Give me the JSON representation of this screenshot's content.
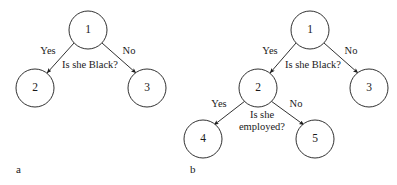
{
  "figure": {
    "width": 397,
    "height": 185,
    "background": "#ffffff",
    "stroke_color": "#1a1a1a"
  },
  "panels": [
    {
      "caption": "a",
      "caption_x": 16,
      "caption_y": 170,
      "nodes": [
        {
          "id": "a1",
          "label": "1",
          "cx": 88,
          "cy": 30,
          "r": 19
        },
        {
          "id": "a2",
          "label": "2",
          "cx": 35,
          "cy": 88,
          "r": 19
        },
        {
          "id": "a3",
          "label": "3",
          "cx": 147,
          "cy": 88,
          "r": 19
        }
      ],
      "edges": [
        {
          "id": "a-edge-yes",
          "from": "a1",
          "to": "a2",
          "label": "Yes",
          "label_x": 48,
          "label_y": 52,
          "x1": 74,
          "y1": 43,
          "x2": 47,
          "y2": 73
        },
        {
          "id": "a-edge-no",
          "from": "a1",
          "to": "a3",
          "label": "No",
          "label_x": 129,
          "label_y": 52,
          "x1": 102,
          "y1": 43,
          "x2": 136,
          "y2": 73
        }
      ],
      "question": {
        "lines": [
          "Is she Black?"
        ],
        "x": 90,
        "y": 66
      }
    },
    {
      "caption": "b",
      "caption_x": 190,
      "caption_y": 170,
      "nodes": [
        {
          "id": "b1",
          "label": "1",
          "cx": 310,
          "cy": 30,
          "r": 19
        },
        {
          "id": "b2",
          "label": "2",
          "cx": 258,
          "cy": 88,
          "r": 19
        },
        {
          "id": "b3",
          "label": "3",
          "cx": 369,
          "cy": 88,
          "r": 19
        },
        {
          "id": "b4",
          "label": "4",
          "cx": 203,
          "cy": 139,
          "r": 19
        },
        {
          "id": "b5",
          "label": "5",
          "cx": 315,
          "cy": 139,
          "r": 19
        }
      ],
      "edges": [
        {
          "id": "b-edge-yes-1",
          "from": "b1",
          "to": "b2",
          "label": "Yes",
          "label_x": 270,
          "label_y": 52,
          "x1": 296,
          "y1": 43,
          "x2": 270,
          "y2": 73
        },
        {
          "id": "b-edge-no-1",
          "from": "b1",
          "to": "b3",
          "label": "No",
          "label_x": 351,
          "label_y": 52,
          "x1": 324,
          "y1": 43,
          "x2": 358,
          "y2": 73
        },
        {
          "id": "b-edge-yes-2",
          "from": "b2",
          "to": "b4",
          "label": "Yes",
          "label_x": 219,
          "label_y": 105,
          "x1": 245,
          "y1": 101,
          "x2": 214,
          "y2": 125
        },
        {
          "id": "b-edge-no-2",
          "from": "b2",
          "to": "b5",
          "label": "No",
          "label_x": 296,
          "label_y": 105,
          "x1": 271,
          "y1": 101,
          "x2": 304,
          "y2": 125
        }
      ],
      "questions": [
        {
          "id": "b-question-1",
          "lines": [
            "Is she Black?"
          ],
          "x": 313,
          "y": 66
        },
        {
          "id": "b-question-2",
          "lines": [
            "Is she",
            "employed?"
          ],
          "x": 262,
          "y": 116
        }
      ]
    }
  ]
}
